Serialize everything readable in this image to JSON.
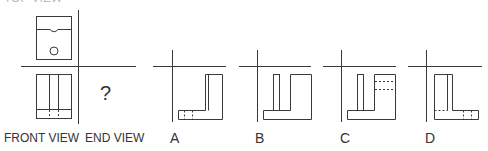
{
  "top_label_partial": "TOP VIEW",
  "question": {
    "unknown_symbol": "?",
    "labels": {
      "front": "FRONT VIEW",
      "end": "END VIEW"
    }
  },
  "options": [
    {
      "letter": "A"
    },
    {
      "letter": "B"
    },
    {
      "letter": "C"
    },
    {
      "letter": "D"
    }
  ],
  "colors": {
    "line": "#3a3a3a",
    "background": "#ffffff"
  }
}
